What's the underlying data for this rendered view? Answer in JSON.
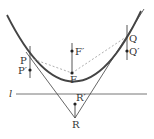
{
  "diagram": {
    "type": "parabola-reflection",
    "colors": {
      "curve": "#444444",
      "line": "#555555",
      "dashed": "#999999",
      "point": "#222222",
      "text": "#333333"
    },
    "labels": {
      "P": "P",
      "P_prime": "P′",
      "F": "F",
      "F_prime": "F′",
      "Q": "Q",
      "Q_prime": "Q′",
      "R": "R",
      "R_prime": "R′",
      "l": "l"
    }
  }
}
